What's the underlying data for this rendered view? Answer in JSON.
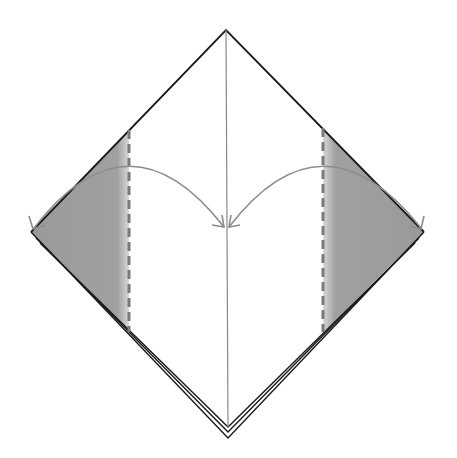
{
  "diagram": {
    "type": "origami-fold-instruction",
    "colors": {
      "background": "#ffffff",
      "outline": "#1a1a1a",
      "crease": "#888888",
      "fold_line": "#7a7a7a",
      "shade": "#9a9a9a",
      "arrow": "#8c8c8c"
    },
    "steps": [
      {
        "id": "left-fold",
        "action": "valley fold left corner to center line"
      },
      {
        "id": "right-fold",
        "action": "valley fold right corner to center line"
      }
    ]
  }
}
